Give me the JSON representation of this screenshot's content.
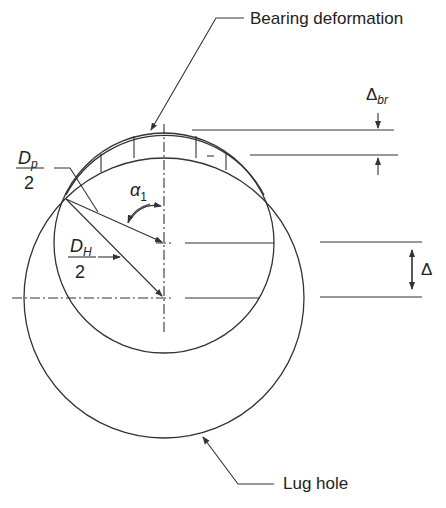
{
  "diagram": {
    "colors": {
      "line": "#333333",
      "text": "#222222",
      "background": "#ffffff"
    },
    "labels": {
      "bearing_deformation": "Bearing deformation",
      "lug_hole": "Lug hole",
      "delta_br_symbol": "Δ",
      "delta_br_sub": "br",
      "delta": "Δ",
      "alpha_symbol": "α",
      "alpha_sub": "1",
      "dp_num": "D",
      "dp_sub": "p",
      "dp_den": "2",
      "dh_num": "D",
      "dh_sub": "H",
      "dh_den": "2"
    },
    "elements": {
      "pin_circle": {
        "label": "D_p/2",
        "center": [
          164,
          243
        ],
        "radius": 110
      },
      "lug_hole_circle": {
        "label": "D_H/2",
        "center": [
          164,
          298
        ],
        "radius": 140
      },
      "deformation_band": {
        "outer_radius": 112,
        "ticks": 4
      },
      "dimensions": [
        "Δ_br",
        "Δ",
        "α_1"
      ]
    }
  }
}
